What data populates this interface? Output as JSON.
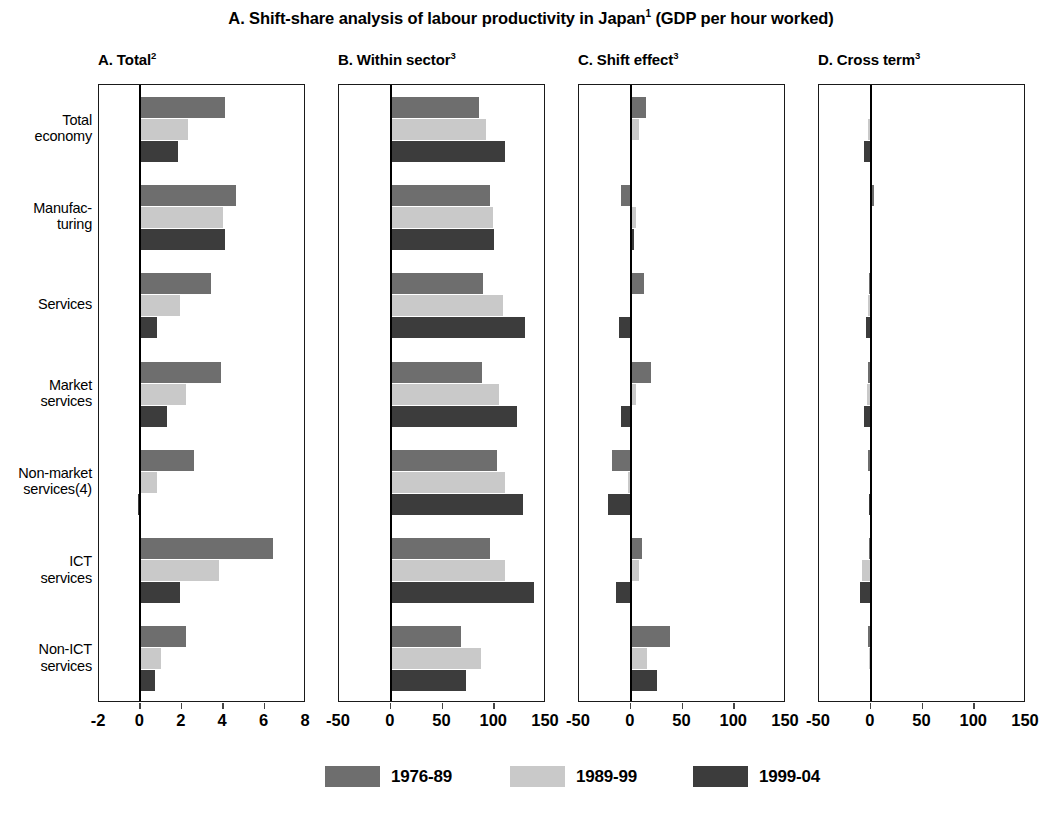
{
  "figure": {
    "title_main": "A. Shift-share analysis of labour productivity in Japan",
    "title_sup": "1",
    "title_tail": " (GDP per hour worked)"
  },
  "legend": {
    "items": [
      {
        "label": "1976-89",
        "color": "#6e6e6e"
      },
      {
        "label": "1989-99",
        "color": "#c9c9c9"
      },
      {
        "label": "1999-04",
        "color": "#3c3c3c"
      }
    ]
  },
  "categories": [
    "Total\neconomy",
    "Manufac-\nturing",
    "Services",
    "Market\nservices",
    "Non-market\nservices(4)",
    "ICT\nservices",
    "Non-ICT\nservices"
  ],
  "series_names": [
    "1976-89",
    "1989-99",
    "1999-04"
  ],
  "chart_data": {
    "type": "bar",
    "title": "A. Shift-share analysis of labour productivity in Japan1 (GDP per hour worked)",
    "orientation": "horizontal",
    "grid": false,
    "legend_position": "bottom",
    "categories": [
      "Total economy",
      "Manufacturing",
      "Services",
      "Market services",
      "Non-market services(4)",
      "ICT services",
      "Non-ICT services"
    ],
    "panels": [
      {
        "key": "total",
        "label": "A. Total",
        "label_sup": "2",
        "xlabel": "",
        "ylabel": "",
        "xlim": [
          -2,
          8
        ],
        "xticks": [
          -2,
          0,
          2,
          4,
          6,
          8
        ],
        "xticklabels": [
          "-2",
          "0",
          "2",
          "4",
          "6",
          "8"
        ],
        "series": [
          {
            "name": "1976-89",
            "values": [
              4.1,
              4.6,
              3.4,
              3.9,
              2.6,
              6.4,
              2.2
            ]
          },
          {
            "name": "1989-99",
            "values": [
              2.3,
              4.0,
              1.9,
              2.2,
              0.8,
              3.8,
              1.0
            ]
          },
          {
            "name": "1999-04",
            "values": [
              1.8,
              4.1,
              0.8,
              1.3,
              -0.1,
              1.9,
              0.7
            ]
          }
        ]
      },
      {
        "key": "within",
        "label": "B. Within sector",
        "label_sup": "3",
        "xlabel": "",
        "ylabel": "",
        "xlim": [
          -50,
          150
        ],
        "xticks": [
          -50,
          0,
          50,
          100,
          150
        ],
        "xticklabels": [
          "-50",
          "0",
          "50",
          "100",
          "150"
        ],
        "series": [
          {
            "name": "1976-89",
            "values": [
              85,
              96,
              89,
              88,
              103,
              96,
              68
            ]
          },
          {
            "name": "1989-99",
            "values": [
              92,
              99,
              108,
              105,
              110,
              110,
              87
            ]
          },
          {
            "name": "1999-04",
            "values": [
              110,
              100,
              130,
              122,
              128,
              138,
              73
            ]
          }
        ]
      },
      {
        "key": "shift",
        "label": "C. Shift effect",
        "label_sup": "3",
        "xlabel": "",
        "ylabel": "",
        "xlim": [
          -50,
          150
        ],
        "xticks": [
          -50,
          0,
          50,
          100,
          150
        ],
        "xticklabels": [
          "-50",
          "0",
          "50",
          "100",
          "150"
        ],
        "series": [
          {
            "name": "1976-89",
            "values": [
              15,
              -9,
              13,
              20,
              -18,
              11,
              38
            ]
          },
          {
            "name": "1989-99",
            "values": [
              8,
              5,
              0,
              5,
              -3,
              8,
              16
            ]
          },
          {
            "name": "1999-04",
            "values": [
              0,
              3,
              -11,
              -9,
              -22,
              -14,
              25
            ]
          }
        ]
      },
      {
        "key": "cross",
        "label": "D. Cross term",
        "label_sup": "3",
        "xlabel": "",
        "ylabel": "",
        "xlim": [
          -50,
          150
        ],
        "xticks": [
          -50,
          0,
          50,
          100,
          150
        ],
        "xticklabels": [
          "-50",
          "0",
          "50",
          "100",
          "150"
        ],
        "series": [
          {
            "name": "1976-89",
            "values": [
              1,
              3,
              -2,
              -3,
              -3,
              -2,
              -3
            ]
          },
          {
            "name": "1989-99",
            "values": [
              -3,
              0,
              -3,
              -4,
              -1,
              -8,
              -2
            ]
          },
          {
            "name": "1999-04",
            "values": [
              -7,
              0,
              -5,
              -7,
              -2,
              -10,
              1
            ]
          }
        ]
      }
    ]
  }
}
